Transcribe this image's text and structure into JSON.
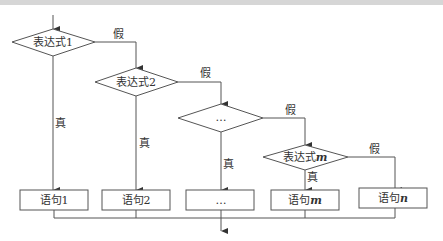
{
  "diagram": {
    "type": "flowchart",
    "colors": {
      "stroke": "#555555",
      "text": "#333333",
      "background": "#ffffff",
      "top_band": "#d6d6d6"
    },
    "decisions": [
      {
        "id": "d1",
        "label_main": "表达式",
        "label_var": "1"
      },
      {
        "id": "d2",
        "label_main": "表达式",
        "label_var": "2"
      },
      {
        "id": "d3",
        "label_main": "…",
        "label_var": ""
      },
      {
        "id": "dm",
        "label_main": "表达式",
        "label_var": "m"
      }
    ],
    "statements": [
      {
        "id": "s1",
        "label_main": "语句",
        "label_var": "1"
      },
      {
        "id": "s2",
        "label_main": "语句",
        "label_var": "2"
      },
      {
        "id": "s3",
        "label_main": "…",
        "label_var": ""
      },
      {
        "id": "sm",
        "label_main": "语句",
        "label_var": "m"
      },
      {
        "id": "sn",
        "label_main": "语句",
        "label_var": "n"
      }
    ],
    "edge_labels": {
      "true": "真",
      "false": "假"
    }
  }
}
